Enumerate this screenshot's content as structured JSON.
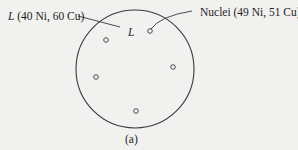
{
  "diagram": {
    "liquid_label": {
      "symbol": "L",
      "composition": " (40 Ni, 60 Cu)"
    },
    "inner_label": "L",
    "nuclei_label": "Nuclei (49 Ni, 51 Cu)",
    "caption": "(a)",
    "colors": {
      "background": "#f1f1ef",
      "stroke": "#3a3a3a",
      "text": "#1e1e1e"
    }
  }
}
